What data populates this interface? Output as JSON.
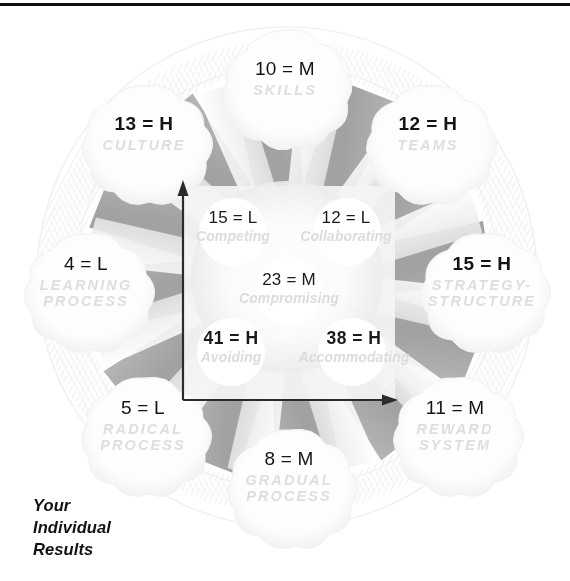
{
  "caption": {
    "line1": "Your",
    "line2": "Individual",
    "line3": "Results"
  },
  "outer_nodes": [
    {
      "id": "skills",
      "score": "10 = M",
      "name": "SKILLS",
      "level": "M",
      "x": 285,
      "y": 78,
      "emphasis": "normal"
    },
    {
      "id": "culture",
      "score": "13 = H",
      "name": "CULTURE",
      "level": "H",
      "x": 144,
      "y": 133,
      "emphasis": "strong"
    },
    {
      "id": "teams",
      "score": "12 = H",
      "name": "TEAMS",
      "level": "H",
      "x": 428,
      "y": 133,
      "emphasis": "strong"
    },
    {
      "id": "learning-process",
      "score": "4 = L",
      "name": "LEARNING PROCESS",
      "level": "L",
      "x": 86,
      "y": 283,
      "emphasis": "normal"
    },
    {
      "id": "strategy-structure",
      "score": "15 = H",
      "name": "STRATEGY- STRUCTURE",
      "level": "H",
      "x": 482,
      "y": 283,
      "emphasis": "strong"
    },
    {
      "id": "radical-process",
      "score": "5 = L",
      "name": "RADICAL PROCESS",
      "level": "L",
      "x": 143,
      "y": 427,
      "emphasis": "normal"
    },
    {
      "id": "reward-system",
      "score": "11 = M",
      "name": "REWARD SYSTEM",
      "level": "M",
      "x": 455,
      "y": 427,
      "emphasis": "normal"
    },
    {
      "id": "gradual-process",
      "score": "8 = M",
      "name": "GRADUAL PROCESS",
      "level": "M",
      "x": 289,
      "y": 478,
      "emphasis": "normal"
    }
  ],
  "inner_nodes": [
    {
      "id": "competing",
      "score": "15 = L",
      "name": "Competing",
      "level": "L",
      "x": 233,
      "y": 226,
      "emphasis": "normal"
    },
    {
      "id": "collaborating",
      "score": "12 = L",
      "name": "Collaborating",
      "level": "L",
      "x": 345,
      "y": 226,
      "emphasis": "normal"
    },
    {
      "id": "compromising",
      "score": "23 = M",
      "name": "Compromising",
      "level": "M",
      "x": 289,
      "y": 288,
      "emphasis": "normal"
    },
    {
      "id": "avoiding",
      "score": "41 = H",
      "name": "Avoiding",
      "level": "H",
      "x": 230,
      "y": 347,
      "emphasis": "strong"
    },
    {
      "id": "accommodating",
      "score": "38 = H",
      "name": "Accommodating",
      "level": "H",
      "x": 353,
      "y": 347,
      "emphasis": "strong"
    }
  ],
  "axes": {
    "vertical_arrow": "up",
    "horizontal_arrow": "right",
    "origin_x": 183,
    "origin_y": 400,
    "top_y": 182,
    "right_x": 396
  },
  "colors": {
    "text": "#141414",
    "ghost_label": "#dedede",
    "spoke_gray": "#a0a0a0",
    "panel": "#f2f2f2",
    "rule": "#111111",
    "background": "#ffffff"
  }
}
